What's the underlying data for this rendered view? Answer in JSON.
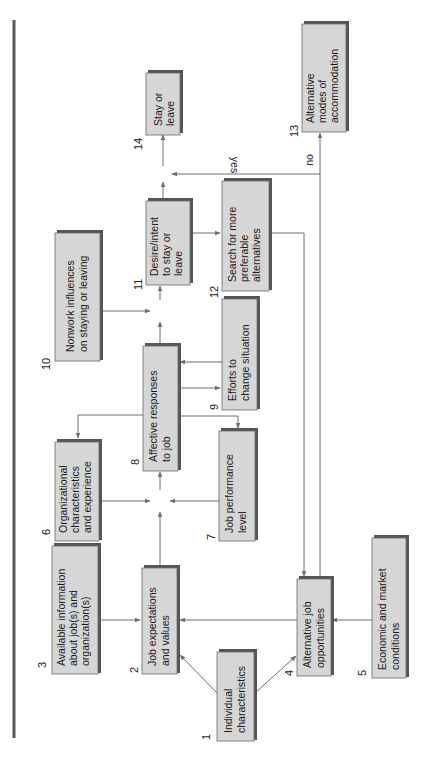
{
  "diagram": {
    "orientation": "rotated-90-ccw",
    "nodes": [
      {
        "id": 1,
        "number": "1",
        "lines": [
          "Individual",
          "characteristics"
        ]
      },
      {
        "id": 2,
        "number": "2",
        "lines": [
          "Job expectations",
          "and values"
        ]
      },
      {
        "id": 3,
        "number": "3",
        "lines": [
          "Available information",
          "about job(s)  and",
          "organization(s)"
        ]
      },
      {
        "id": 4,
        "number": "4",
        "lines": [
          "Alternative job",
          "opportunities"
        ]
      },
      {
        "id": 5,
        "number": "5",
        "lines": [
          "Economic and market",
          "conditions"
        ]
      },
      {
        "id": 6,
        "number": "6",
        "lines": [
          "Organizational",
          "characteristics",
          "and experience"
        ]
      },
      {
        "id": 7,
        "number": "7",
        "lines": [
          "Job performance",
          "level"
        ]
      },
      {
        "id": 8,
        "number": "8",
        "lines": [
          "Affective responses",
          "to job"
        ]
      },
      {
        "id": 9,
        "number": "9",
        "lines": [
          "Efforts to",
          "change situation"
        ]
      },
      {
        "id": 10,
        "number": "10",
        "lines": [
          "Nonwork influences",
          "on staying or leaving"
        ]
      },
      {
        "id": 11,
        "number": "11",
        "lines": [
          "Desire/intent",
          "to stay or",
          "leave"
        ]
      },
      {
        "id": 12,
        "number": "12",
        "lines": [
          "Search for more",
          "preferable",
          "alternatives"
        ]
      },
      {
        "id": 13,
        "number": "13",
        "lines": [
          "Alternative",
          "modes of",
          "accommodation"
        ]
      },
      {
        "id": 14,
        "number": "14",
        "lines": [
          "Stay or",
          "leave"
        ]
      }
    ],
    "edge_labels": {
      "yes": "yes",
      "no": "no"
    },
    "edges": [
      {
        "from": 1,
        "to": 2
      },
      {
        "from": 1,
        "to": 4
      },
      {
        "from": 3,
        "to": 2
      },
      {
        "from": 4,
        "to": 2
      },
      {
        "from": 5,
        "to": 4
      },
      {
        "from": 2,
        "to": 8
      },
      {
        "from": 6,
        "to": 8
      },
      {
        "from": 7,
        "to": 8
      },
      {
        "from": 8,
        "to": 6
      },
      {
        "from": 8,
        "to": 7
      },
      {
        "from": 8,
        "to": 9
      },
      {
        "from": 9,
        "to": 8
      },
      {
        "from": 8,
        "to": 11
      },
      {
        "from": 10,
        "to": 11
      },
      {
        "from": 11,
        "to": 12
      },
      {
        "from": 11,
        "to": 14
      },
      {
        "from": 12,
        "to": 4
      },
      {
        "from": 4,
        "to": 14,
        "label": "yes"
      },
      {
        "from": 4,
        "to": 13,
        "label": "no"
      }
    ],
    "colors": {
      "box_fill": "#d6d6d6",
      "box_shadow": "#555555",
      "line": "#6e6e6e",
      "separator": "#5a5a5a"
    }
  }
}
